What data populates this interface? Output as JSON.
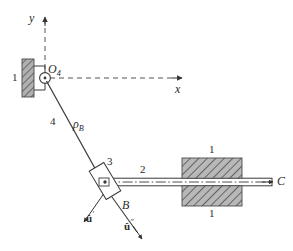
{
  "figure": {
    "type": "mechanism-kinematic-diagram",
    "background_color": "#ffffff",
    "stroke_color": "#3a3a3a",
    "hatch_fill_color": "#b9b9b9",
    "hatch_line_color": "#555555"
  },
  "axes": {
    "y_label": "y",
    "x_label": "x",
    "origin_label": "O",
    "origin_subscript": "4",
    "style": "dashed-with-arrowheads"
  },
  "labels": {
    "ground_left": "1",
    "ground_block_top": "1",
    "ground_block_bottom": "1",
    "link_four": "4",
    "rho_b": "ρ",
    "rho_b_subscript": "B",
    "slider_three": "3",
    "rod_two": "2",
    "point_b": "B",
    "point_c": "C",
    "unit_vector_prime": "û",
    "unit_vector_prime_sup": "′",
    "unit_vector_double_prime": "û",
    "unit_vector_double_prime_sup": "″"
  },
  "geometry": {
    "pivot_o4": {
      "x": 45,
      "y": 78,
      "radius": 5.5
    },
    "point_b": {
      "x": 107,
      "y": 182
    },
    "point_c": {
      "x": 272,
      "y": 182
    },
    "y_axis": {
      "x": 45,
      "y_top": 18,
      "y_bottom": 78
    },
    "x_axis": {
      "y": 78,
      "x_left": 45,
      "x_right": 182
    },
    "ground_wall": {
      "x": 22,
      "y": 60,
      "width": 13,
      "height": 36
    },
    "guide_block": {
      "x": 182,
      "y": 160,
      "width": 60,
      "height": 45
    },
    "slider_block": {
      "cx": 105,
      "cy": 182,
      "width": 17,
      "height": 34,
      "rotation_deg": -31
    },
    "rod": {
      "x_left": 105,
      "x_right": 272,
      "y": 182,
      "thickness": 7
    },
    "unit_vec_prime": {
      "from_x": 107,
      "from_y": 190,
      "to_x": 84,
      "to_y": 222
    },
    "unit_vec_double_prime": {
      "from_x": 107,
      "from_y": 190,
      "to_x": 140,
      "to_y": 236
    }
  }
}
